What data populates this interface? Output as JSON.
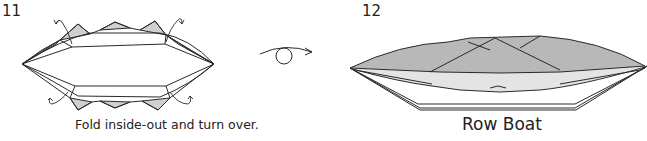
{
  "steps": [
    {
      "number": "11",
      "caption": "Fold inside-out and turn over.",
      "icons": [
        "fold-arrow-icon",
        "paper-model-open"
      ]
    },
    {
      "number": "12",
      "caption": "Row Boat",
      "icons": [
        "paper-model-row-boat"
      ]
    }
  ],
  "transition": {
    "icon": "turn-over-icon"
  },
  "colors": {
    "line": "#2a2a2a",
    "fill_dark": "#b8b8b8",
    "fill_light": "#d8d8d8",
    "fill_pale": "#e6e6e6",
    "background": "#ffffff"
  }
}
